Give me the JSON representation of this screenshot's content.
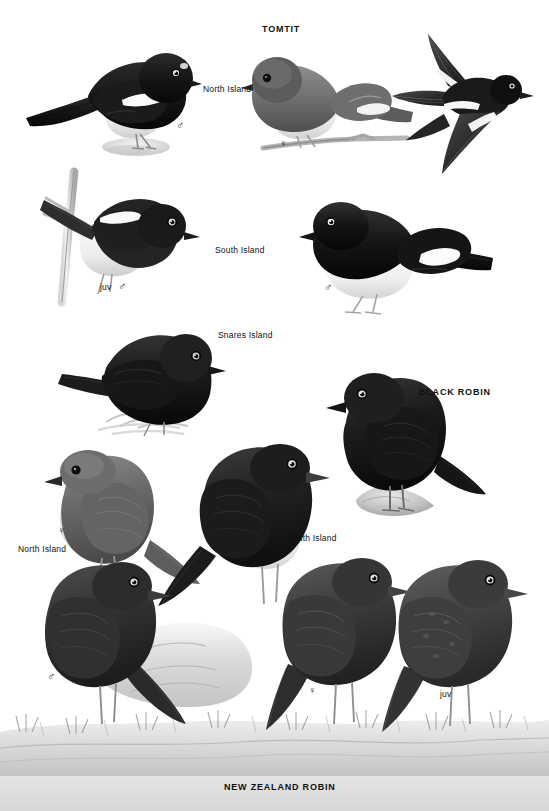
{
  "plate": {
    "width": 549,
    "height": 811,
    "background": "#ffffff",
    "ink": "#111111",
    "medium_grey": "#7d7d7d",
    "light_grey": "#c9c9c9",
    "pale_wash": "#e2e2e2",
    "black": "#151515"
  },
  "species": [
    {
      "id": "tomtit",
      "name": "TOMTIT"
    },
    {
      "id": "black-robin",
      "name": "BLACK ROBIN"
    },
    {
      "id": "nz-robin",
      "name": "NEW ZEALAND ROBIN"
    }
  ],
  "headings": {
    "tomtit": {
      "text": "TOMTIT",
      "x": 262,
      "y": 30
    },
    "black_robin": {
      "text": "BLACK ROBIN",
      "x": 419,
      "y": 392
    },
    "nz_robin": {
      "text": "NEW ZEALAND ROBIN",
      "x": 224,
      "y": 786
    }
  },
  "figures": [
    {
      "id": "tomtit-north-island-male",
      "species": "TOMTIT",
      "subspecies_label": "North Island",
      "sex": "male",
      "sex_symbol": "♂",
      "label_x": 203,
      "label_y": 88,
      "symbol_x": 178,
      "symbol_y": 122,
      "plumage": "black head, back, wings and tail; white breast and belly; white wing bar; white frontal spot",
      "pose": "perched, facing right, leaning forward on rock"
    },
    {
      "id": "tomtit-north-island-female",
      "species": "TOMTIT",
      "subspecies_label": "North Island",
      "sex": "female",
      "sex_symbol": "♀",
      "symbol_x": 281,
      "symbol_y": 140,
      "plumage": "grey-brown upperparts, pale buff-white underparts, pale wing bar",
      "pose": "perched on twig, facing left"
    },
    {
      "id": "tomtit-flight",
      "species": "TOMTIT",
      "subspecies_label": "",
      "sex": "",
      "sex_symbol": "",
      "plumage": "black above with bold white wing bars and white wing patches",
      "pose": "in flight, wings spread, viewed from above/side"
    },
    {
      "id": "tomtit-juvenile-male",
      "species": "TOMTIT",
      "subspecies_label": "",
      "sex": "juvenile male",
      "sex_symbol": "♂",
      "juv_text": "juv",
      "symbol_x": 110,
      "symbol_y": 286,
      "plumage": "black head and upperparts, white underparts, white wing bar",
      "pose": "perched on vertical twig, facing right"
    },
    {
      "id": "tomtit-south-island-male",
      "species": "TOMTIT",
      "subspecies_label": "South Island",
      "sex": "male",
      "sex_symbol": "♂",
      "label_x": 215,
      "label_y": 249,
      "symbol_x": 326,
      "symbol_y": 284,
      "plumage": "black head, back and wings; clean white breast and belly; white wing flash",
      "pose": "perched, facing left"
    },
    {
      "id": "tomtit-snares-island",
      "species": "TOMTIT",
      "subspecies_label": "Snares Island",
      "sex": "",
      "sex_symbol": "",
      "label_x": 218,
      "label_y": 334,
      "plumage": "entirely sooty black",
      "pose": "perched on grass tussock, facing right"
    },
    {
      "id": "black-robin",
      "species": "BLACK ROBIN",
      "subspecies_label": "",
      "sex": "",
      "sex_symbol": "",
      "plumage": "uniformly black, stout bill, long dark legs",
      "pose": "perched upright on rock, facing left"
    },
    {
      "id": "nz-robin-north-island-female",
      "species": "NEW ZEALAND ROBIN",
      "subspecies_label": "North Island",
      "sex": "female",
      "sex_symbol": "♀",
      "label_x": 18,
      "label_y": 548,
      "symbol_x": 59,
      "symbol_y": 527,
      "plumage": "dark grey-brown upperparts, paler grey-white underparts",
      "pose": "perched facing left, long legs"
    },
    {
      "id": "nz-robin-south-island-male",
      "species": "NEW ZEALAND ROBIN",
      "subspecies_label": "South Island",
      "sex": "male",
      "sex_symbol": "♂",
      "label_x": 287,
      "label_y": 537,
      "symbol_x": 250,
      "symbol_y": 559,
      "plumage": "blackish upperparts and breast, bright white lower breast and belly",
      "pose": "perched upright facing right"
    },
    {
      "id": "nz-robin-male-lower",
      "species": "NEW ZEALAND ROBIN",
      "subspecies_label": "",
      "sex": "male",
      "sex_symbol": "♂",
      "symbol_x": 49,
      "symbol_y": 673,
      "plumage": "dark slaty grey overall, slightly paler below",
      "pose": "perched on mossy bank facing right"
    },
    {
      "id": "nz-robin-female-lower",
      "species": "NEW ZEALAND ROBIN",
      "subspecies_label": "",
      "sex": "female",
      "sex_symbol": "♀",
      "symbol_x": 310,
      "symbol_y": 687,
      "plumage": "dark grey-brown, paler belly",
      "pose": "perched on moss facing right"
    },
    {
      "id": "nz-robin-juvenile",
      "species": "NEW ZEALAND ROBIN",
      "subspecies_label": "",
      "sex": "juvenile",
      "sex_symbol": "",
      "juv_text": "juv",
      "label_x": 440,
      "label_y": 693,
      "plumage": "dull brown-grey, mottled, paler belly",
      "pose": "perched on grass facing right"
    }
  ],
  "labels": {
    "north_island_top": "North Island",
    "south_island_tomtit": "South Island",
    "snares_island": "Snares Island",
    "juv_male_tomtit": "juv",
    "north_island_robin": "North Island",
    "south_island_robin": "South Island",
    "juv_robin": "juv"
  },
  "symbols": {
    "male": "♂",
    "female": "♀"
  }
}
